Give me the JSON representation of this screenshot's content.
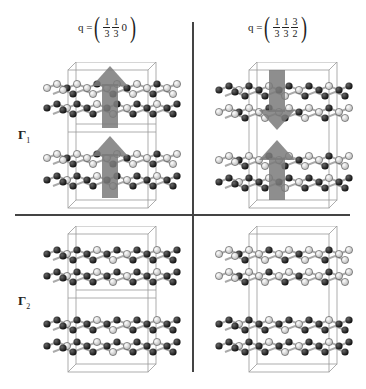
{
  "columns": [
    {
      "q_label": {
        "prefix": "q =",
        "components": [
          {
            "type": "fraction",
            "num": "1",
            "den": "3"
          },
          {
            "type": "fraction",
            "num": "1",
            "den": "3"
          },
          {
            "type": "plain",
            "value": "0"
          }
        ]
      }
    },
    {
      "q_label": {
        "prefix": "q =",
        "components": [
          {
            "type": "fraction",
            "num": "1",
            "den": "3"
          },
          {
            "type": "fraction",
            "num": "1",
            "den": "3"
          },
          {
            "type": "fraction",
            "num": "3",
            "den": "2"
          }
        ]
      }
    }
  ],
  "rows": [
    {
      "label": "Γ",
      "subscript": "1"
    },
    {
      "label": "Γ",
      "subscript": "2"
    }
  ],
  "panels": [
    {
      "row": 0,
      "col": 0,
      "arrows": [
        "up",
        "up"
      ],
      "top_pair": "light",
      "bottom_pair": "mixed"
    },
    {
      "row": 0,
      "col": 1,
      "arrows": [
        "down",
        "up"
      ],
      "top_pair": "mixed",
      "bottom_pair": "mixed"
    },
    {
      "row": 1,
      "col": 0,
      "arrows": [],
      "top_pair": "dark",
      "bottom_pair": "dark"
    },
    {
      "row": 1,
      "col": 1,
      "arrows": [],
      "top_pair": "light",
      "bottom_pair": "dark"
    }
  ],
  "colors": {
    "divider": "#444444",
    "arrow": "#7a7a7a",
    "atom_dark": "#1a1a1a",
    "atom_light": "#f2f2f2",
    "cell_box": "#999999",
    "bond": "#aaaaaa"
  }
}
